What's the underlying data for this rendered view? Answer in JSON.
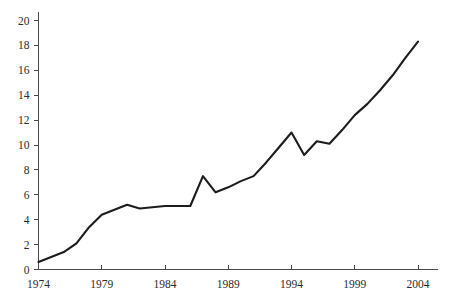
{
  "chart_data": {
    "type": "line",
    "title": "",
    "subtitle": "",
    "xlabel": "",
    "ylabel": "",
    "x": [
      1974,
      1975,
      1976,
      1977,
      1978,
      1979,
      1980,
      1981,
      1982,
      1983,
      1984,
      1985,
      1986,
      1987,
      1988,
      1989,
      1990,
      1991,
      1992,
      1993,
      1994,
      1995,
      1996,
      1997,
      1998,
      1999,
      2000,
      2001,
      2002,
      2003,
      2004
    ],
    "values": [
      0.6,
      1.0,
      1.4,
      2.1,
      3.4,
      4.4,
      4.8,
      5.2,
      4.9,
      5.0,
      5.1,
      5.1,
      5.1,
      7.5,
      6.2,
      6.6,
      7.1,
      7.5,
      8.6,
      9.8,
      11.0,
      9.2,
      10.3,
      10.1,
      11.2,
      12.4,
      13.3,
      14.4,
      15.6,
      17.0,
      18.3
    ],
    "series": [
      {
        "name": "value",
        "values": [
          0.6,
          1.0,
          1.4,
          2.1,
          3.4,
          4.4,
          4.8,
          5.2,
          4.9,
          5.0,
          5.1,
          5.1,
          5.1,
          7.5,
          6.2,
          6.6,
          7.1,
          7.5,
          8.6,
          9.8,
          11.0,
          9.2,
          10.3,
          10.1,
          11.2,
          12.4,
          13.3,
          14.4,
          15.6,
          17.0,
          18.3
        ]
      }
    ],
    "xlim": [
      1974,
      2004
    ],
    "ylim": [
      0,
      21
    ],
    "x_ticks": [
      1974,
      1979,
      1984,
      1989,
      1994,
      1999,
      2004
    ],
    "x_tick_labels": [
      "1974",
      "1979",
      "1984",
      "1989",
      "1994",
      "1999",
      "2004"
    ],
    "y_ticks": [
      0,
      2,
      4,
      6,
      8,
      10,
      12,
      14,
      16,
      18,
      20
    ],
    "y_tick_labels": [
      "0",
      "2",
      "4",
      "6",
      "8",
      "10",
      "12",
      "14",
      "16",
      "18",
      "20"
    ],
    "grid": false,
    "legend": false,
    "legend_position": "none",
    "annotations": [],
    "colors": {
      "line": "#1c1c1c",
      "axis": "#4a4a4a",
      "background": "#ffffff",
      "tick_label": "#2b2b2b"
    }
  }
}
